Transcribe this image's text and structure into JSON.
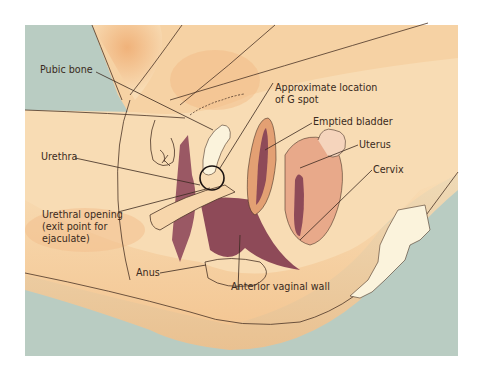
{
  "figure": {
    "type": "anatomical-illustration",
    "colors": {
      "background_panel": "#b8cbc1",
      "skin_light": "#f8dcb4",
      "skin_shadow": "#f0b880",
      "tissue_dark": "#8e4a58",
      "tissue_mid": "#c98a78",
      "uterus_fill": "#e8a98a",
      "bone_fill": "#fbf3dc",
      "line_color": "#3b2a1f",
      "label_color": "#3a2a20"
    },
    "labels": [
      {
        "id": "pubic-bone",
        "lines": [
          "Pubic bone"
        ]
      },
      {
        "id": "g-spot",
        "lines": [
          "Approximate location",
          "of G spot"
        ]
      },
      {
        "id": "emptied-bladder",
        "lines": [
          "Emptied bladder"
        ]
      },
      {
        "id": "urethra",
        "lines": [
          "Urethra"
        ]
      },
      {
        "id": "uterus",
        "lines": [
          "Uterus"
        ]
      },
      {
        "id": "cervix",
        "lines": [
          "Cervix"
        ]
      },
      {
        "id": "urethral-opening",
        "lines": [
          "Urethral opening",
          "(exit point for",
          "ejaculate)"
        ]
      },
      {
        "id": "anus",
        "lines": [
          "Anus"
        ]
      },
      {
        "id": "anterior-vaginal-wall",
        "lines": [
          "Anterior vaginal wall"
        ]
      }
    ]
  }
}
